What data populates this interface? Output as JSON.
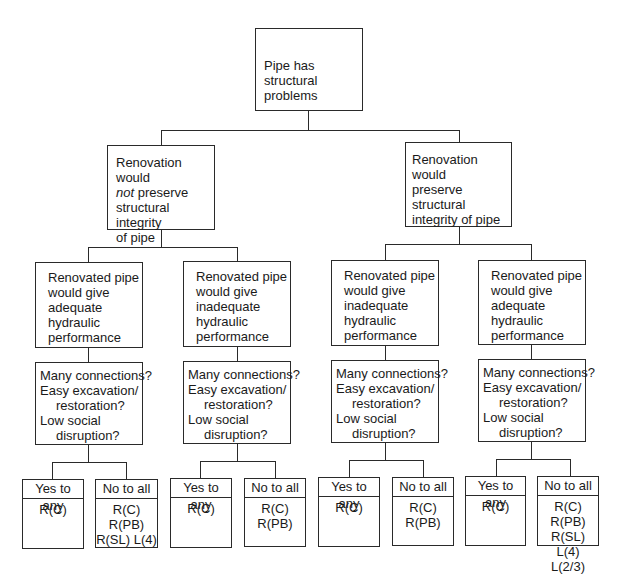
{
  "root": {
    "label": "Pipe has\nstructural problems"
  },
  "level2": [
    {
      "label_pre": "Renovation would\n",
      "label_em": "not",
      "label_post": " preserve\nstructural integrity\nof pipe"
    },
    {
      "label": "Renovation would\npreserve structural\nintegrity of pipe"
    }
  ],
  "level3": [
    {
      "label": "Renovated pipe\nwould give\nadequate\nhydraulic\nperformance"
    },
    {
      "label": "Renovated pipe\nwould give\ninadequate\nhydraulic\nperformance"
    },
    {
      "label": "Renovated pipe\nwould give\ninadequate\nhydraulic\nperformance"
    },
    {
      "label": "Renovated pipe\nwould give\nadequate\nhydraulic\nperformance"
    }
  ],
  "question": {
    "line1": "Many connections?",
    "line2": "Easy excavation/",
    "line3": "restoration?",
    "line4": "Low social",
    "line5": "disruption?"
  },
  "leaves": [
    {
      "head": "Yes to any",
      "body": "R(C)"
    },
    {
      "head": "No to all",
      "body": "R(C) R(PB)\nR(SL) L(4)"
    },
    {
      "head": "Yes to any",
      "body": "R(C)"
    },
    {
      "head": "No to all",
      "body": "R(C) R(PB)"
    },
    {
      "head": "Yes to any",
      "body": "R(C)"
    },
    {
      "head": "No to all",
      "body": "R(C) R(PB)"
    },
    {
      "head": "Yes to any",
      "body": "R(C)"
    },
    {
      "head": "No to all",
      "body": "R(C) R(PB)\nR(SL) L(4)\nL(2/3)"
    }
  ]
}
